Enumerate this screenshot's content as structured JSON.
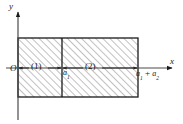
{
  "figure": {
    "type": "two-region-rectangle-diagram",
    "title": "",
    "axes": {
      "x_label": "x",
      "y_label": "y",
      "origin_label": "O",
      "x_axis_y_px": 68,
      "y_axis_x_px": 18,
      "x_arrow": true,
      "y_arrow": true
    },
    "regions": [
      {
        "id": "1",
        "label": "(1)",
        "x_start": "0",
        "x_end": "a₁",
        "hatched": true
      },
      {
        "id": "2",
        "label": "(2)",
        "x_start": "a₁",
        "x_end": "a₁ + a₂",
        "hatched": true
      }
    ],
    "ticks": [
      {
        "label_main": "a",
        "label_sub": "1",
        "label_text": "a₁",
        "x_px": 62
      },
      {
        "label_main": "a",
        "label_sub": "1",
        "label_op": " + ",
        "label_main2": "a",
        "label_sub2": "2",
        "label_text": "a₁ + a₂",
        "x_px": 138
      }
    ],
    "rectangle": {
      "left_px": 18,
      "right_px": 138,
      "top_px": 38,
      "bottom_px": 97,
      "divider_x_px": 62
    },
    "dimension_arrows": [
      {
        "region": "1",
        "from_px": 18,
        "to_px": 62,
        "double_headed": true
      },
      {
        "region": "2",
        "from_px": 62,
        "to_px": 138,
        "double_headed": true
      }
    ],
    "colors": {
      "line": "#1a1a1a",
      "hatch": "#8a8a8a",
      "fill": "#ffffff",
      "background": "#ffffff"
    }
  }
}
